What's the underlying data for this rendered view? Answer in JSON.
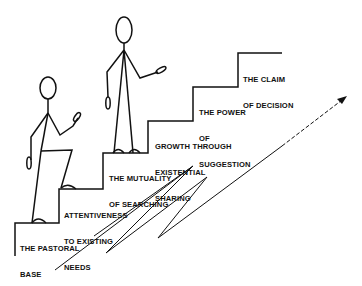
{
  "diagram": {
    "type": "staircase-illustration",
    "steps": [
      {
        "label_lines": [
          "THE PASTORAL",
          "BASE"
        ]
      },
      {
        "label_lines": [
          "ATTENTIVENESS",
          "TO EXISTING",
          "NEEDS"
        ]
      },
      {
        "label_lines": [
          "THE MUTUALITY",
          "OF SEARCHING"
        ]
      },
      {
        "label_lines": [
          "GROWTH THROUGH",
          "EXISTENTIAL",
          "SHARING"
        ]
      },
      {
        "label_lines": [
          "THE POWER",
          "OF",
          "SUGGESTION"
        ]
      },
      {
        "label_lines": [
          "THE CLAIM",
          "OF DECISION"
        ]
      }
    ],
    "figures": [
      "stick-figure-climbing",
      "stick-figure-standing"
    ],
    "arrow": {
      "style": "solid-then-dashed",
      "direction": "up-right"
    },
    "colors": {
      "ink": "#111111",
      "background": "#ffffff"
    }
  }
}
